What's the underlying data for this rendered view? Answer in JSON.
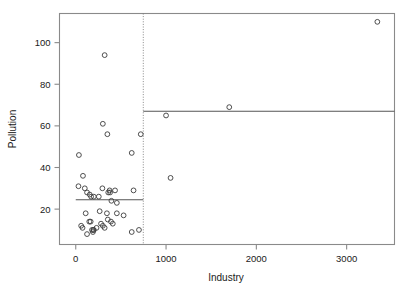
{
  "chart_data": {
    "type": "scatter",
    "title": "",
    "xlabel": "Industry",
    "ylabel": "Pollution",
    "xlim": [
      -180,
      3530
    ],
    "ylim": [
      3,
      114
    ],
    "xticks": [
      0,
      1000,
      2000,
      3000
    ],
    "xticklabels": [
      "0",
      "1000",
      "2000",
      "3000"
    ],
    "yticks": [
      20,
      40,
      60,
      80,
      100
    ],
    "yticklabels": [
      "20",
      "40",
      "60",
      "80",
      "100"
    ],
    "grid": false,
    "legend": null,
    "points": [
      {
        "x": 35,
        "y": 46
      },
      {
        "x": 30,
        "y": 31
      },
      {
        "x": 80,
        "y": 36
      },
      {
        "x": 100,
        "y": 30
      },
      {
        "x": 125,
        "y": 28
      },
      {
        "x": 155,
        "y": 27
      },
      {
        "x": 170,
        "y": 26
      },
      {
        "x": 200,
        "y": 26
      },
      {
        "x": 255,
        "y": 26
      },
      {
        "x": 295,
        "y": 30
      },
      {
        "x": 300,
        "y": 61
      },
      {
        "x": 320,
        "y": 94
      },
      {
        "x": 350,
        "y": 56
      },
      {
        "x": 360,
        "y": 28
      },
      {
        "x": 375,
        "y": 29
      },
      {
        "x": 380,
        "y": 28
      },
      {
        "x": 395,
        "y": 24
      },
      {
        "x": 435,
        "y": 29
      },
      {
        "x": 455,
        "y": 23
      },
      {
        "x": 620,
        "y": 47
      },
      {
        "x": 640,
        "y": 29
      },
      {
        "x": 60,
        "y": 12
      },
      {
        "x": 75,
        "y": 11
      },
      {
        "x": 110,
        "y": 18
      },
      {
        "x": 125,
        "y": 8
      },
      {
        "x": 150,
        "y": 14
      },
      {
        "x": 165,
        "y": 14
      },
      {
        "x": 180,
        "y": 10
      },
      {
        "x": 190,
        "y": 9
      },
      {
        "x": 195,
        "y": 10
      },
      {
        "x": 200,
        "y": 10
      },
      {
        "x": 230,
        "y": 11
      },
      {
        "x": 265,
        "y": 19
      },
      {
        "x": 280,
        "y": 13
      },
      {
        "x": 300,
        "y": 12
      },
      {
        "x": 320,
        "y": 11
      },
      {
        "x": 345,
        "y": 18
      },
      {
        "x": 355,
        "y": 15
      },
      {
        "x": 390,
        "y": 14
      },
      {
        "x": 410,
        "y": 13
      },
      {
        "x": 455,
        "y": 18
      },
      {
        "x": 530,
        "y": 17
      },
      {
        "x": 620,
        "y": 9
      },
      {
        "x": 700,
        "y": 10
      },
      {
        "x": 720,
        "y": 56
      },
      {
        "x": 1000,
        "y": 65
      },
      {
        "x": 1050,
        "y": 35
      },
      {
        "x": 1700,
        "y": 69
      },
      {
        "x": 3340,
        "y": 110
      }
    ],
    "fit_segments": [
      {
        "x0": 0,
        "x1": 748,
        "y": 24.5
      },
      {
        "x0": 748,
        "x1": 3530,
        "y": 67
      }
    ],
    "split_lines": [
      {
        "x": 748
      }
    ]
  }
}
